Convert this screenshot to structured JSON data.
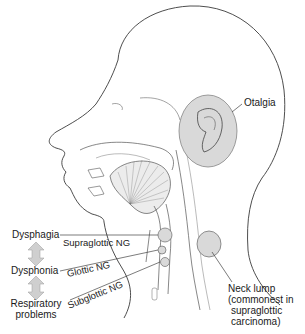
{
  "diagram": {
    "labels": {
      "otalgia": "Otalgia",
      "dysphagia": "Dysphagia",
      "dysphonia": "Dysphonia",
      "respiratory": [
        "Respiratory",
        "problems"
      ],
      "supraglottic": "Supraglottic NG",
      "glottic": "Glottic NG",
      "subglottic": "Subglottic NG",
      "neck_lump": [
        "Neck lump",
        "(commonest in",
        "supraglottic",
        "carcinoma)"
      ]
    },
    "colors": {
      "line": "#3a3a3a",
      "shade": "#d9d9d9",
      "arrow_fill": "#cfcfcf"
    }
  }
}
